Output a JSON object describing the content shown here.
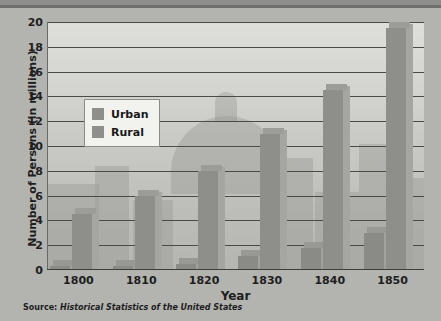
{
  "chart_data": {
    "type": "bar",
    "title": "",
    "xlabel": "Year",
    "ylabel": "Number of Persons (in millions)",
    "categories": [
      "1800",
      "1810",
      "1820",
      "1830",
      "1840",
      "1850"
    ],
    "series": [
      {
        "name": "Urban",
        "values": [
          0.3,
          0.35,
          0.5,
          1.1,
          1.8,
          3.0
        ],
        "color": "#8e8e8b"
      },
      {
        "name": "Rural",
        "values": [
          4.5,
          6.0,
          8.0,
          11.0,
          14.5,
          19.5
        ],
        "color": "#8e8e8b"
      }
    ],
    "ylim": [
      0,
      20
    ],
    "yticks": [
      0,
      2,
      4,
      6,
      8,
      10,
      12,
      14,
      16,
      18,
      20
    ],
    "grid": true,
    "legend_position": "upper-left-inside"
  },
  "legend": {
    "items": [
      {
        "label": "Urban"
      },
      {
        "label": "Rural"
      }
    ]
  },
  "source_note": {
    "label": "Source: ",
    "title": "Historical Statistics of the United States"
  },
  "colors": {
    "bar_face": "#8e8e8b",
    "bar_side": "#a5a5a2",
    "plot_background": "#c8c8c4",
    "figure_background": "#b3b3b0",
    "gridline": "#4a4a48",
    "text": "#1e1e1e"
  }
}
